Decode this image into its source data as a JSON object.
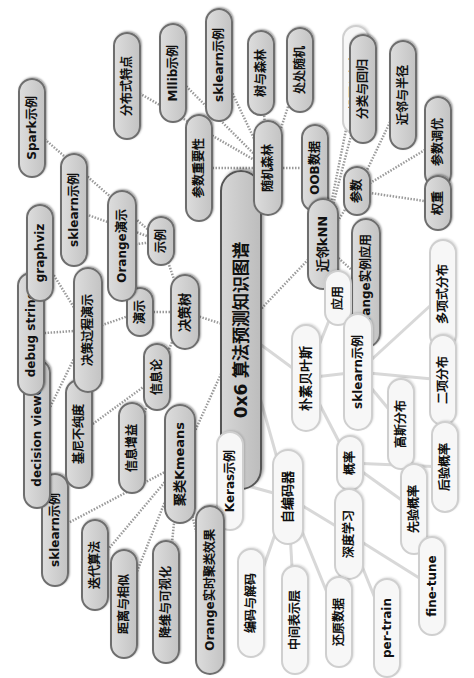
{
  "mindmap": {
    "title": "0x6 算法预测知识图谱",
    "orientation": "rotated -90deg (text reads bottom-to-top)",
    "colors": {
      "gray_fill": "#c8c8c8",
      "gray_border": "#6e6e6e",
      "light_fill": "#f7f7f7",
      "light_border": "#cfcfcf",
      "link": "#9a9a9a",
      "light_link": "#d8d8d8"
    },
    "nodes": [
      {
        "id": "root",
        "label": "0x6 算法预测知识图谱",
        "x": 241,
        "y": 330,
        "w": 320,
        "h": 42,
        "fs": 17,
        "style": "root"
      },
      {
        "id": "rf",
        "label": "随机森林",
        "x": 268,
        "y": 168,
        "w": 96,
        "h": 30,
        "fs": 12,
        "style": "gray"
      },
      {
        "id": "rf_imp",
        "label": "参数重要性",
        "x": 199,
        "y": 168,
        "w": 108,
        "h": 28,
        "fs": 12,
        "style": "gray"
      },
      {
        "id": "rf_oob",
        "label": "OOB数据",
        "x": 315,
        "y": 168,
        "w": 88,
        "h": 28,
        "fs": 12,
        "style": "gray"
      },
      {
        "id": "rf_dist",
        "label": "分布式特点",
        "x": 127,
        "y": 86,
        "w": 108,
        "h": 28,
        "fs": 12,
        "style": "gray"
      },
      {
        "id": "rf_mllib",
        "label": "Mllib示例",
        "x": 173,
        "y": 73,
        "w": 100,
        "h": 28,
        "fs": 12,
        "style": "gray"
      },
      {
        "id": "rf_sklearn",
        "label": "sklearn示例",
        "x": 219,
        "y": 65,
        "w": 114,
        "h": 28,
        "fs": 12,
        "style": "gray"
      },
      {
        "id": "rf_tree",
        "label": "树与森林",
        "x": 261,
        "y": 73,
        "w": 86,
        "h": 28,
        "fs": 12,
        "style": "gray"
      },
      {
        "id": "rf_rand",
        "label": "处处随机",
        "x": 300,
        "y": 70,
        "w": 86,
        "h": 28,
        "fs": 12,
        "style": "gray"
      },
      {
        "id": "knn",
        "label": "近邻kNN",
        "x": 323,
        "y": 244,
        "w": 92,
        "h": 32,
        "fs": 13,
        "style": "gray"
      },
      {
        "id": "knn_vote",
        "label": "投票与加权",
        "x": 356,
        "y": 80,
        "w": 110,
        "h": 28,
        "fs": 12,
        "style": "light"
      },
      {
        "id": "knn_cls",
        "label": "分类与回归",
        "x": 363,
        "y": 89,
        "w": 0,
        "h": 0,
        "fs": 0,
        "style": "hidden"
      },
      {
        "id": "knn_param",
        "label": "参数",
        "x": 357,
        "y": 191,
        "w": 50,
        "h": 28,
        "fs": 12,
        "style": "gray"
      },
      {
        "id": "knn_orange",
        "label": "Orange实例应用",
        "x": 366,
        "y": 283,
        "w": 130,
        "h": 30,
        "fs": 12,
        "style": "gray"
      },
      {
        "id": "knn_radius",
        "label": "近邻与半径",
        "x": 403,
        "y": 95,
        "w": 110,
        "h": 28,
        "fs": 12,
        "style": "gray"
      },
      {
        "id": "knn_tune",
        "label": "参数调优",
        "x": 438,
        "y": 142,
        "w": 92,
        "h": 28,
        "fs": 12,
        "style": "gray"
      },
      {
        "id": "knn_weight",
        "label": "权重",
        "x": 438,
        "y": 203,
        "w": 56,
        "h": 28,
        "fs": 12,
        "style": "gray"
      },
      {
        "id": "nb",
        "label": "朴素贝叶斯",
        "x": 306,
        "y": 378,
        "w": 108,
        "h": 30,
        "fs": 13,
        "style": "light"
      },
      {
        "id": "nb_app",
        "label": "应用",
        "x": 338,
        "y": 298,
        "w": 56,
        "h": 28,
        "fs": 12,
        "style": "light"
      },
      {
        "id": "nb_sk",
        "label": "sklearn示例",
        "x": 358,
        "y": 372,
        "w": 118,
        "h": 30,
        "fs": 12,
        "style": "light"
      },
      {
        "id": "nb_multi",
        "label": "多项式分布",
        "x": 443,
        "y": 294,
        "w": 110,
        "h": 28,
        "fs": 12,
        "style": "light"
      },
      {
        "id": "nb_binom",
        "label": "二项分布",
        "x": 443,
        "y": 380,
        "w": 92,
        "h": 28,
        "fs": 12,
        "style": "light"
      },
      {
        "id": "nb_gauss",
        "label": "高斯分布",
        "x": 401,
        "y": 424,
        "w": 92,
        "h": 28,
        "fs": 12,
        "style": "light"
      },
      {
        "id": "nb_prob",
        "label": "概率",
        "x": 350,
        "y": 463,
        "w": 56,
        "h": 28,
        "fs": 12,
        "style": "light"
      },
      {
        "id": "nb_post",
        "label": "后验概率",
        "x": 445,
        "y": 467,
        "w": 92,
        "h": 28,
        "fs": 12,
        "style": "light"
      },
      {
        "id": "nb_prior",
        "label": "先验概率",
        "x": 414,
        "y": 509,
        "w": 92,
        "h": 28,
        "fs": 12,
        "style": "light"
      },
      {
        "id": "ae",
        "label": "自编码器",
        "x": 288,
        "y": 497,
        "w": 96,
        "h": 32,
        "fs": 13,
        "style": "light"
      },
      {
        "id": "ae_keras",
        "label": "Keras示例",
        "x": 230,
        "y": 481,
        "w": 100,
        "h": 28,
        "fs": 12,
        "style": "light"
      },
      {
        "id": "ae_deep",
        "label": "深度学习",
        "x": 349,
        "y": 534,
        "w": 92,
        "h": 30,
        "fs": 12,
        "style": "light"
      },
      {
        "id": "ae_enc",
        "label": "编码与解码",
        "x": 251,
        "y": 603,
        "w": 110,
        "h": 28,
        "fs": 12,
        "style": "light"
      },
      {
        "id": "ae_mid",
        "label": "中间表示层",
        "x": 295,
        "y": 620,
        "w": 110,
        "h": 28,
        "fs": 12,
        "style": "light"
      },
      {
        "id": "ae_restore",
        "label": "还原数据",
        "x": 339,
        "y": 622,
        "w": 92,
        "h": 28,
        "fs": 12,
        "style": "light"
      },
      {
        "id": "ae_pre",
        "label": "per-train",
        "x": 387,
        "y": 628,
        "w": 100,
        "h": 28,
        "fs": 12,
        "style": "light"
      },
      {
        "id": "ae_fine",
        "label": "fine-tune",
        "x": 432,
        "y": 586,
        "w": 100,
        "h": 28,
        "fs": 12,
        "style": "light"
      },
      {
        "id": "km",
        "label": "聚类Kmeans",
        "x": 180,
        "y": 464,
        "w": 120,
        "h": 32,
        "fs": 13,
        "style": "gray"
      },
      {
        "id": "km_sk",
        "label": "sklearn示例",
        "x": 55,
        "y": 530,
        "w": 114,
        "h": 28,
        "fs": 12,
        "style": "gray"
      },
      {
        "id": "km_iter",
        "label": "迭代算法",
        "x": 95,
        "y": 565,
        "w": 92,
        "h": 28,
        "fs": 12,
        "style": "gray"
      },
      {
        "id": "km_dist",
        "label": "距离与相似",
        "x": 124,
        "y": 604,
        "w": 110,
        "h": 28,
        "fs": 12,
        "style": "gray"
      },
      {
        "id": "km_vis",
        "label": "降维与可视化",
        "x": 166,
        "y": 602,
        "w": 124,
        "h": 28,
        "fs": 12,
        "style": "gray"
      },
      {
        "id": "km_orange",
        "label": "Orange实时聚类效果",
        "x": 210,
        "y": 590,
        "w": 170,
        "h": 30,
        "fs": 12,
        "style": "gray"
      },
      {
        "id": "dt",
        "label": "决策树",
        "x": 185,
        "y": 312,
        "w": 76,
        "h": 30,
        "fs": 13,
        "style": "gray"
      },
      {
        "id": "dt_info",
        "label": "信息论",
        "x": 157,
        "y": 377,
        "w": 68,
        "h": 28,
        "fs": 12,
        "style": "gray"
      },
      {
        "id": "dt_gain",
        "label": "信息增益",
        "x": 132,
        "y": 448,
        "w": 92,
        "h": 28,
        "fs": 12,
        "style": "gray"
      },
      {
        "id": "dt_gini",
        "label": "基尼不纯度",
        "x": 79,
        "y": 434,
        "w": 110,
        "h": 28,
        "fs": 12,
        "style": "gray"
      },
      {
        "id": "dt_viewer",
        "label": "decision viewer",
        "x": 37,
        "y": 434,
        "w": 150,
        "h": 28,
        "fs": 12,
        "style": "gray"
      },
      {
        "id": "dt_demo",
        "label": "演示",
        "x": 140,
        "y": 312,
        "w": 50,
        "h": 28,
        "fs": 12,
        "style": "gray"
      },
      {
        "id": "dt_proc",
        "label": "决策过程演示",
        "x": 88,
        "y": 330,
        "w": 126,
        "h": 30,
        "fs": 12,
        "style": "gray"
      },
      {
        "id": "dt_debug",
        "label": "debug string",
        "x": 31,
        "y": 334,
        "w": 124,
        "h": 28,
        "fs": 12,
        "style": "gray"
      },
      {
        "id": "dt_graphviz",
        "label": "graphviz",
        "x": 40,
        "y": 253,
        "w": 98,
        "h": 28,
        "fs": 12,
        "style": "gray"
      },
      {
        "id": "dt_ex",
        "label": "示例",
        "x": 161,
        "y": 241,
        "w": 50,
        "h": 28,
        "fs": 12,
        "style": "gray"
      },
      {
        "id": "dt_orange",
        "label": "Orange演示",
        "x": 122,
        "y": 246,
        "w": 112,
        "h": 30,
        "fs": 12,
        "style": "gray"
      },
      {
        "id": "dt_sk",
        "label": "sklearn示例",
        "x": 74,
        "y": 210,
        "w": 114,
        "h": 28,
        "fs": 12,
        "style": "gray"
      },
      {
        "id": "dt_spark",
        "label": "Spark示例",
        "x": 32,
        "y": 128,
        "w": 100,
        "h": 28,
        "fs": 12,
        "style": "gray"
      }
    ],
    "extra_nodes": [
      {
        "id": "knn_cls2",
        "label": "分类与回归",
        "x": 363,
        "y": 89,
        "w": 110,
        "h": 28,
        "fs": 12,
        "style": "gray"
      }
    ],
    "links": [
      [
        "root",
        "rf",
        0
      ],
      [
        "rf",
        "rf_imp",
        0
      ],
      [
        "rf",
        "rf_oob",
        0
      ],
      [
        "rf",
        "rf_dist",
        0
      ],
      [
        "rf",
        "rf_mllib",
        0
      ],
      [
        "rf",
        "rf_sklearn",
        0
      ],
      [
        "rf",
        "rf_tree",
        0
      ],
      [
        "rf",
        "rf_rand",
        0
      ],
      [
        "root",
        "knn",
        0
      ],
      [
        "knn",
        "knn_vote",
        0
      ],
      [
        "knn",
        "knn_param",
        0
      ],
      [
        "knn",
        "knn_orange",
        0
      ],
      [
        "knn_param",
        "knn_radius",
        0
      ],
      [
        "knn_param",
        "knn_tune",
        0
      ],
      [
        "knn_param",
        "knn_weight",
        0
      ],
      [
        "knn",
        "knn_cls2",
        0
      ],
      [
        "root",
        "nb",
        1
      ],
      [
        "nb",
        "nb_app",
        1
      ],
      [
        "nb",
        "nb_sk",
        1
      ],
      [
        "nb_sk",
        "nb_multi",
        1
      ],
      [
        "nb_sk",
        "nb_binom",
        1
      ],
      [
        "nb_sk",
        "nb_gauss",
        1
      ],
      [
        "nb",
        "nb_prob",
        1
      ],
      [
        "nb_prob",
        "nb_post",
        1
      ],
      [
        "nb_prob",
        "nb_prior",
        1
      ],
      [
        "root",
        "ae",
        1
      ],
      [
        "ae",
        "ae_keras",
        1
      ],
      [
        "ae",
        "ae_deep",
        1
      ],
      [
        "ae",
        "ae_enc",
        1
      ],
      [
        "ae",
        "ae_mid",
        1
      ],
      [
        "ae",
        "ae_restore",
        1
      ],
      [
        "ae_deep",
        "ae_pre",
        1
      ],
      [
        "ae_deep",
        "ae_fine",
        1
      ],
      [
        "root",
        "km",
        0
      ],
      [
        "km",
        "km_sk",
        0
      ],
      [
        "km",
        "km_iter",
        0
      ],
      [
        "km",
        "km_dist",
        0
      ],
      [
        "km",
        "km_vis",
        0
      ],
      [
        "km",
        "km_orange",
        0
      ],
      [
        "root",
        "dt",
        0
      ],
      [
        "dt",
        "dt_info",
        0
      ],
      [
        "dt_info",
        "dt_gain",
        0
      ],
      [
        "dt_info",
        "dt_gini",
        0
      ],
      [
        "dt",
        "dt_demo",
        0
      ],
      [
        "dt_demo",
        "dt_proc",
        0
      ],
      [
        "dt_proc",
        "dt_debug",
        0
      ],
      [
        "dt_proc",
        "dt_viewer",
        0
      ],
      [
        "dt_proc",
        "dt_graphviz",
        0
      ],
      [
        "dt",
        "dt_ex",
        0
      ],
      [
        "dt_ex",
        "dt_orange",
        0
      ],
      [
        "dt_ex",
        "dt_sk",
        0
      ],
      [
        "dt_ex",
        "dt_spark",
        0
      ]
    ]
  }
}
